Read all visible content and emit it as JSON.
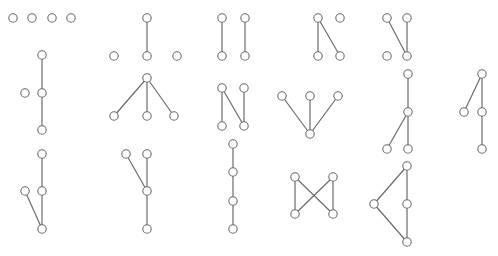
{
  "colors": {
    "edge": "#6b6b6b",
    "node_fill": "#ffffff",
    "node_stroke": "#6b6b6b",
    "background": "#ffffff"
  },
  "graphs": [
    {
      "name": "empty-graph",
      "nodes": 4,
      "edges": []
    },
    {
      "name": "single-edge",
      "nodes": 4,
      "edges": [
        [
          0,
          2
        ]
      ]
    },
    {
      "name": "two-disjoint-edges",
      "nodes": 4,
      "edges": [
        [
          0,
          2
        ],
        [
          1,
          3
        ]
      ]
    },
    {
      "name": "path-p3-plus-isolated",
      "nodes": 4,
      "edges": [
        [
          0,
          2
        ],
        [
          0,
          3
        ]
      ]
    },
    {
      "name": "path-p3-plus-isolated-alt",
      "nodes": 4,
      "edges": [
        [
          0,
          3
        ],
        [
          1,
          3
        ]
      ]
    },
    {
      "name": "path-p3-with-isolated-vertex",
      "nodes": 4,
      "edges": [
        [
          0,
          2
        ],
        [
          2,
          3
        ]
      ]
    },
    {
      "name": "star-k13",
      "nodes": 4,
      "edges": [
        [
          0,
          1
        ],
        [
          0,
          2
        ],
        [
          0,
          3
        ]
      ]
    },
    {
      "name": "path-p4-n-shape",
      "nodes": 4,
      "edges": [
        [
          0,
          2
        ],
        [
          0,
          3
        ],
        [
          1,
          3
        ]
      ]
    },
    {
      "name": "star-k13-inverted",
      "nodes": 4,
      "edges": [
        [
          0,
          3
        ],
        [
          1,
          3
        ],
        [
          2,
          3
        ]
      ]
    },
    {
      "name": "star-k13-y-shape",
      "nodes": 4,
      "edges": [
        [
          0,
          1
        ],
        [
          1,
          2
        ],
        [
          1,
          3
        ]
      ]
    },
    {
      "name": "star-k13-alt",
      "nodes": 4,
      "edges": [
        [
          0,
          1
        ],
        [
          0,
          2
        ],
        [
          2,
          3
        ]
      ]
    },
    {
      "name": "path-p4-variant",
      "nodes": 4,
      "edges": [
        [
          0,
          2
        ],
        [
          2,
          3
        ],
        [
          1,
          3
        ]
      ]
    },
    {
      "name": "star-k13-variant",
      "nodes": 4,
      "edges": [
        [
          0,
          2
        ],
        [
          1,
          2
        ],
        [
          2,
          3
        ]
      ]
    },
    {
      "name": "path-p4",
      "nodes": 4,
      "edges": [
        [
          0,
          1
        ],
        [
          1,
          2
        ],
        [
          2,
          3
        ]
      ]
    },
    {
      "name": "cycle-c4-bowtie",
      "nodes": 4,
      "edges": [
        [
          0,
          2
        ],
        [
          1,
          3
        ],
        [
          0,
          3
        ],
        [
          1,
          2
        ]
      ]
    },
    {
      "name": "cycle-c4-triangle",
      "nodes": 4,
      "edges": [
        [
          0,
          1
        ],
        [
          0,
          2
        ],
        [
          2,
          3
        ],
        [
          1,
          3
        ]
      ]
    }
  ]
}
